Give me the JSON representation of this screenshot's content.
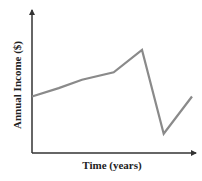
{
  "chart_data": {
    "type": "line",
    "title": "",
    "xlabel": "Time (years)",
    "ylabel": "Annual Income ($)",
    "x_ticks": [],
    "y_ticks": [],
    "grid": false,
    "legend": null,
    "series": [
      {
        "name": "Annual Income",
        "color": "#808080",
        "points_relative": [
          {
            "x": 0.0,
            "y": 0.5
          },
          {
            "x": 0.16,
            "y": 0.59
          },
          {
            "x": 0.3,
            "y": 0.68
          },
          {
            "x": 0.49,
            "y": 0.76
          },
          {
            "x": 0.66,
            "y": 1.0
          },
          {
            "x": 0.79,
            "y": 0.1
          },
          {
            "x": 0.96,
            "y": 0.5
          }
        ]
      }
    ],
    "annotations": "Qualitative sketch: no numeric axis scale. Income rises steadily, peaks, drops sharply to a low, then partially recovers."
  },
  "axes": {
    "axis_color": "#333333",
    "line_color": "#8a8a8a"
  }
}
